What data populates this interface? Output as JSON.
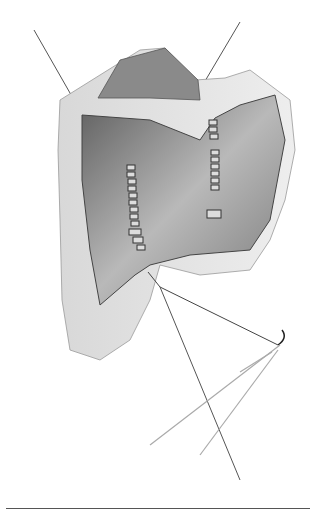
{
  "figure": {
    "colors": {
      "background": "#ffffff",
      "tissue_dark": "#6a6a6a",
      "tissue_mid": "#a8a8a8",
      "tissue_light": "#e2e2e2",
      "line": "#444444"
    }
  }
}
